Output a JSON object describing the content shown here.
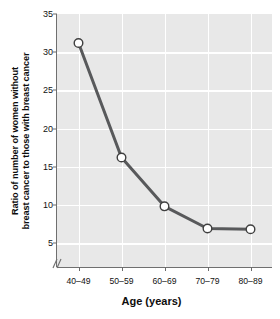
{
  "chart_data": {
    "type": "line",
    "title": "",
    "xlabel": "Age (years)",
    "ylabel": "Ratio of number of women without breast cancer to those with breast cancer",
    "ylabel_lines": [
      "Ratio of number of women without",
      "breast cancer to those with breast cancer"
    ],
    "categories": [
      "40–49",
      "50–59",
      "60–69",
      "70–79",
      "80–89"
    ],
    "values": [
      31.2,
      16.2,
      9.8,
      6.9,
      6.8
    ],
    "series": [
      {
        "name": "Ratio of women without breast cancer to those with breast cancer",
        "values": [
          31.2,
          16.2,
          9.8,
          6.9,
          6.8
        ]
      }
    ],
    "yticks": [
      5,
      10,
      15,
      20,
      25,
      30,
      35
    ],
    "ylim": [
      1.2,
      35
    ],
    "ytick_min": 5,
    "ytick_max": 35,
    "xlim": [
      0,
      5
    ],
    "grid": true,
    "grid_color": "#ffffff",
    "legend": "none",
    "axis_break": "∕∕",
    "has_y_axis_break": true,
    "plot_background": "#e8e8e8",
    "figure_background": "#ffffff",
    "line_color": "#58595b",
    "marker_face_color": "#ffffff",
    "marker_edge_color": "#3f3f3f",
    "axis_color": "#6f6f6f",
    "text_color": "#111111"
  }
}
